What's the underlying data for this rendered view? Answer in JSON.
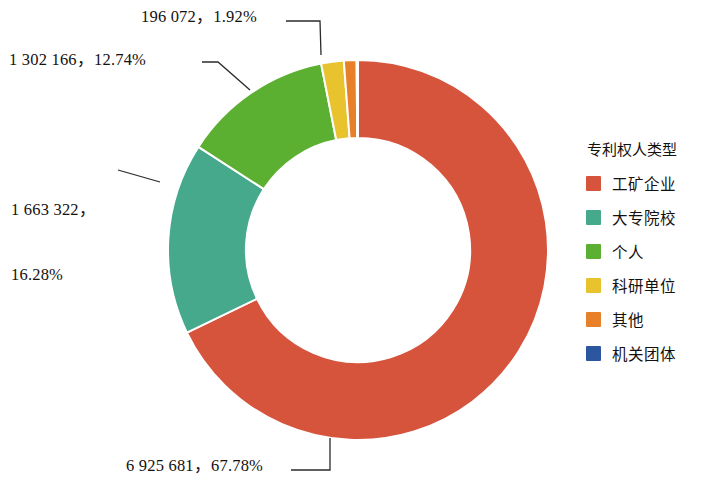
{
  "legend": {
    "title": "专利权人类型",
    "items": [
      {
        "label": "工矿企业",
        "color": "#d6533c"
      },
      {
        "label": "大专院校",
        "color": "#46a98c"
      },
      {
        "label": "个人",
        "color": "#5cb031"
      },
      {
        "label": "科研单位",
        "color": "#e8c32d"
      },
      {
        "label": "其他",
        "color": "#e8802a"
      },
      {
        "label": "机关团体",
        "color": "#2c56a0"
      }
    ]
  },
  "callouts": {
    "kyu": "196 072，1.92%",
    "green": "1 302 166，12.74%",
    "teal_line1": "1 663 322，",
    "teal_line2": "16.28%",
    "red": "6 925 681，67.78%"
  },
  "chart_data": {
    "type": "pie",
    "title": "专利权人类型",
    "subtitle": "",
    "xlabel": "",
    "ylabel": "",
    "donut": true,
    "inner_radius_ratio": 0.59,
    "start_angle_deg": 0,
    "direction": "clockwise",
    "legend_position": "right",
    "grid": false,
    "total": 10218833,
    "categories": [
      "工矿企业",
      "大专院校",
      "个人",
      "科研单位",
      "其他",
      "机关团体"
    ],
    "values": [
      6925681,
      1663322,
      1302166,
      196072,
      110000,
      11592
    ],
    "percents": [
      67.78,
      16.28,
      12.74,
      1.92,
      1.08,
      0.11
    ],
    "colors": [
      "#d6533c",
      "#46a98c",
      "#5cb031",
      "#e8c32d",
      "#e8802a",
      "#2c56a0"
    ],
    "labels": [
      "6 925 681，67.78%",
      "1 663 322，16.28%",
      "1 302 166，12.74%",
      "196 072，1.92%",
      "",
      ""
    ],
    "slice_order_clockwise_from_top": [
      "工矿企业",
      "大专院校",
      "个人",
      "科研单位",
      "其他",
      "机关团体"
    ]
  }
}
